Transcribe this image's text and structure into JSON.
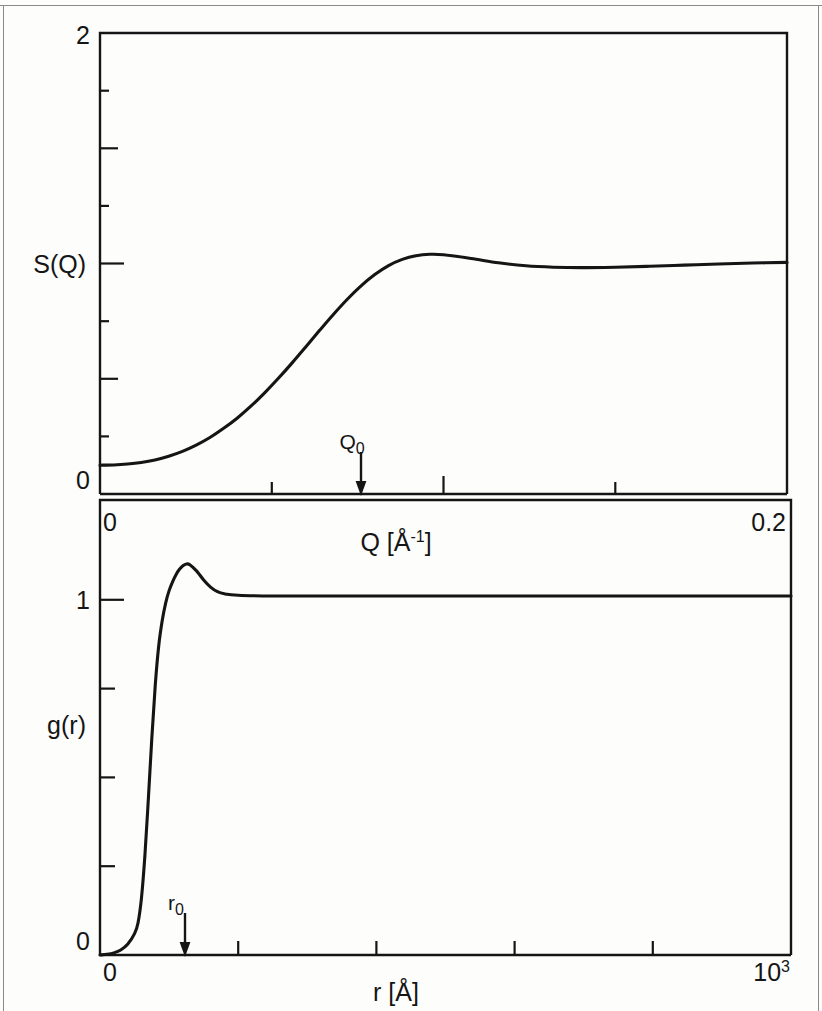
{
  "figure": {
    "kind": "two-panel-scientific-figure",
    "background_color": "#fdfdfc",
    "line_color": "#151515",
    "border_color": "#8a8a8a"
  },
  "panels": {
    "top": {
      "name": "structure-factor-panel",
      "ylabel": "S(Q)",
      "xlabel_main": "Q [",
      "xlabel_unit_symbol": "Å",
      "xlabel_unit_exponent": "-1",
      "xlabel_close": "]",
      "y_tick_labels": {
        "top": "2",
        "bottom": "0"
      },
      "x_tick_labels": {
        "left": "0",
        "right": "0.2"
      },
      "annotation": {
        "symbol": "Q",
        "subscript": "0"
      }
    },
    "bottom": {
      "name": "pair-distribution-panel",
      "ylabel": "g(r)",
      "xlabel_main": "r [",
      "xlabel_unit_symbol": "Å",
      "xlabel_close": "]",
      "y_tick_labels": {
        "one": "1",
        "bottom": "0"
      },
      "x_tick_labels": {
        "left": "0",
        "right_base": "10",
        "right_exponent": "3"
      },
      "annotation": {
        "symbol": "r",
        "subscript": "0"
      }
    }
  },
  "chart_data": [
    {
      "type": "line",
      "name": "structure-factor",
      "title": "",
      "xlabel": "Q [Å⁻¹]",
      "ylabel": "S(Q)",
      "xlim": [
        0,
        0.2
      ],
      "ylim": [
        0,
        2
      ],
      "xticks": [
        0,
        0.05,
        0.1,
        0.15,
        0.2
      ],
      "xtick_labels": [
        "0",
        "",
        "",
        "",
        "0.2"
      ],
      "yticks": [
        0,
        0.25,
        0.5,
        0.75,
        1.0,
        1.25,
        1.5,
        1.75,
        2.0
      ],
      "ytick_labels": [
        "0",
        "",
        "",
        "",
        "",
        "",
        "",
        "",
        "2"
      ],
      "grid": false,
      "legend": null,
      "annotations": [
        {
          "text": "Q₀",
          "x": 0.076,
          "y": 0,
          "arrow": "down"
        }
      ],
      "x": [
        0.0,
        0.004,
        0.008,
        0.012,
        0.016,
        0.02,
        0.024,
        0.028,
        0.032,
        0.036,
        0.04,
        0.044,
        0.048,
        0.052,
        0.056,
        0.06,
        0.064,
        0.068,
        0.072,
        0.076,
        0.08,
        0.084,
        0.088,
        0.092,
        0.096,
        0.1,
        0.108,
        0.116,
        0.124,
        0.132,
        0.14,
        0.15,
        0.16,
        0.17,
        0.18,
        0.19,
        0.2
      ],
      "y": [
        0.125,
        0.126,
        0.13,
        0.137,
        0.148,
        0.164,
        0.185,
        0.212,
        0.245,
        0.285,
        0.33,
        0.382,
        0.44,
        0.503,
        0.57,
        0.64,
        0.711,
        0.78,
        0.845,
        0.903,
        0.952,
        0.991,
        1.018,
        1.034,
        1.04,
        1.038,
        1.022,
        1.003,
        0.99,
        0.984,
        0.982,
        0.984,
        0.988,
        0.993,
        0.998,
        1.002,
        1.005
      ]
    },
    {
      "type": "line",
      "name": "pair-distribution-function",
      "title": "",
      "xlabel": "r [Å]",
      "ylabel": "g(r)",
      "xlim": [
        0,
        1000
      ],
      "ylim": [
        0,
        1.28
      ],
      "xticks": [
        0,
        200,
        400,
        600,
        800,
        1000
      ],
      "xtick_labels": [
        "0",
        "",
        "",
        "",
        "",
        "10³"
      ],
      "yticks": [
        0,
        0.25,
        0.5,
        0.75,
        1.0
      ],
      "ytick_labels": [
        "0",
        "",
        "",
        "",
        "1"
      ],
      "grid": false,
      "legend": null,
      "annotations": [
        {
          "text": "r₀",
          "x": 123,
          "y": 0,
          "arrow": "down"
        }
      ],
      "x": [
        0,
        10,
        20,
        30,
        40,
        50,
        55,
        60,
        65,
        70,
        75,
        80,
        85,
        90,
        95,
        100,
        105,
        110,
        115,
        120,
        125,
        130,
        140,
        150,
        160,
        170,
        180,
        200,
        250,
        300,
        400,
        500,
        600,
        700,
        800,
        900,
        1000
      ],
      "y": [
        0.0,
        0.002,
        0.006,
        0.014,
        0.03,
        0.06,
        0.09,
        0.16,
        0.28,
        0.44,
        0.61,
        0.76,
        0.87,
        0.94,
        0.99,
        1.025,
        1.05,
        1.07,
        1.085,
        1.095,
        1.1,
        1.098,
        1.08,
        1.055,
        1.035,
        1.022,
        1.016,
        1.012,
        1.01,
        1.01,
        1.01,
        1.01,
        1.01,
        1.01,
        1.01,
        1.01,
        1.01
      ]
    }
  ]
}
